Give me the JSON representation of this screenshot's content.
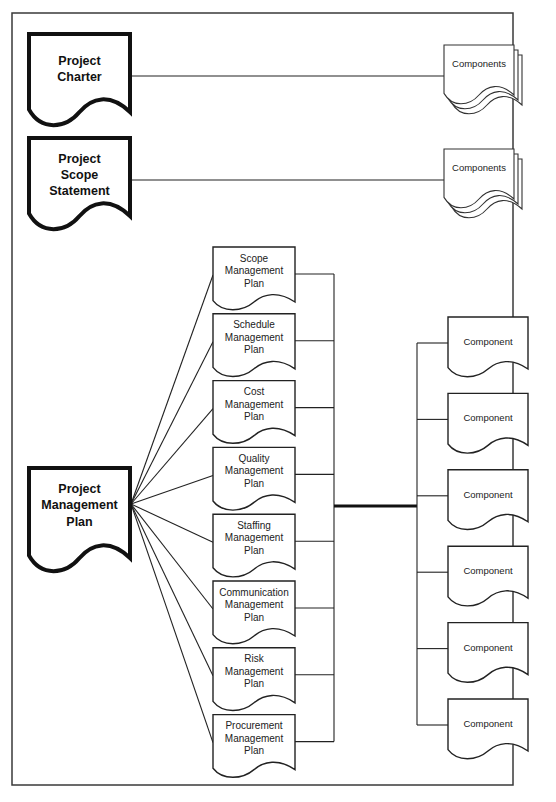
{
  "diagram": {
    "type": "document-hierarchy",
    "top_documents": [
      {
        "id": "project-charter",
        "lines": [
          "Project",
          "Charter"
        ],
        "links_to": "Components",
        "target_style": "stacked-documents"
      },
      {
        "id": "project-scope-statement",
        "lines": [
          "Project",
          "Scope",
          "Statement"
        ],
        "links_to": "Components",
        "target_style": "stacked-documents"
      }
    ],
    "main_document": {
      "id": "project-management-plan",
      "lines": [
        "Project",
        "Management",
        "Plan"
      ]
    },
    "subsidiary_plans": [
      {
        "id": "scope",
        "lines": [
          "Scope",
          "Management",
          "Plan"
        ]
      },
      {
        "id": "schedule",
        "lines": [
          "Schedule",
          "Management",
          "Plan"
        ]
      },
      {
        "id": "cost",
        "lines": [
          "Cost",
          "Management",
          "Plan"
        ]
      },
      {
        "id": "quality",
        "lines": [
          "Quality",
          "Management",
          "Plan"
        ]
      },
      {
        "id": "staffing",
        "lines": [
          "Staffing",
          "Management",
          "Plan"
        ]
      },
      {
        "id": "communication",
        "lines": [
          "Communication",
          "Management",
          "Plan"
        ]
      },
      {
        "id": "risk",
        "lines": [
          "Risk",
          "Management",
          "Plan"
        ]
      },
      {
        "id": "procurement",
        "lines": [
          "Procurement",
          "Management",
          "Plan"
        ]
      }
    ],
    "components_label": "Components",
    "component_label": "Component",
    "component_count": 6
  }
}
